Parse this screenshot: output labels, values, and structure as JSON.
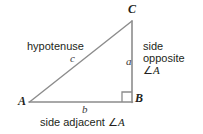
{
  "figure": {
    "colors": {
      "stroke": "#8c8c8c",
      "text": "#231f20",
      "background": "#ffffff"
    },
    "vertices": {
      "c_label": "C",
      "a_label": "A",
      "b_label": "B"
    },
    "sides": {
      "a_label": "a",
      "b_label": "b",
      "c_label": "c"
    },
    "annotations": {
      "hypotenuse": "hypotenuse",
      "side_opposite_line1": "side",
      "side_opposite_line2": "opposite",
      "side_opposite_line3_angle": "∠",
      "side_opposite_line3_vertex": "A",
      "side_adjacent_text": "side adjacent ",
      "side_adjacent_angle": "∠",
      "side_adjacent_vertex": "A"
    },
    "geometry": {
      "vertex_a": [
        29,
        102
      ],
      "vertex_b": [
        132,
        102
      ],
      "vertex_c": [
        132,
        21
      ],
      "right_angle_marker": "square-at-B"
    }
  }
}
